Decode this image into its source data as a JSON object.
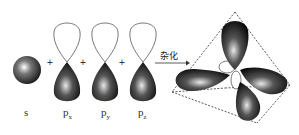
{
  "diagram": {
    "type": "sp3-hybridization",
    "orbitals": [
      {
        "id": "s",
        "label": "s",
        "sub": ""
      },
      {
        "id": "px",
        "label": "p",
        "sub": "x"
      },
      {
        "id": "py",
        "label": "p",
        "sub": "y"
      },
      {
        "id": "pz",
        "label": "p",
        "sub": "z"
      }
    ],
    "operators": [
      "+",
      "+",
      "+"
    ],
    "arrow_label": "杂化",
    "result": "sp3 hybrid orbitals (tetrahedral)",
    "colors": {
      "lobe_dark": "#111111",
      "lobe_light": "#f0f0f0",
      "outline": "#444444",
      "dashed": "#333333"
    }
  }
}
